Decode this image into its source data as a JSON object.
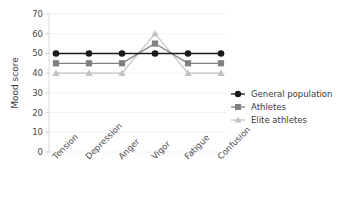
{
  "chart_data": {
    "type": "line",
    "title": "",
    "xlabel": "",
    "ylabel": "Mood score",
    "categories": [
      "Tension",
      "Depression",
      "Anger",
      "Vigor",
      "Fatigue",
      "Confusion"
    ],
    "ylim": [
      0,
      70
    ],
    "yticks": [
      0,
      10,
      20,
      30,
      40,
      50,
      60,
      70
    ],
    "grid": true,
    "legend_position": "right",
    "series": [
      {
        "name": "General population",
        "color": "#1a1a1a",
        "marker": "circle",
        "values": [
          50,
          50,
          50,
          50,
          50,
          50
        ]
      },
      {
        "name": "Athletes",
        "color": "#808080",
        "marker": "square",
        "values": [
          45,
          45,
          45,
          55,
          45,
          45
        ]
      },
      {
        "name": "Elite athletes",
        "color": "#c2c2c2",
        "marker": "triangle",
        "values": [
          40,
          40,
          40,
          60,
          40,
          40
        ]
      }
    ]
  },
  "axis": {
    "y_title": "Mood score",
    "y_tick_labels": [
      "70",
      "60",
      "50",
      "40",
      "30",
      "20",
      "10",
      "0"
    ],
    "x_tick_labels": [
      "Tension",
      "Depression",
      "Anger",
      "Vigor",
      "Fatigue",
      "Confusion"
    ]
  },
  "legend": {
    "items": [
      {
        "label": "General population"
      },
      {
        "label": "Athletes"
      },
      {
        "label": "Elite athletes"
      }
    ]
  }
}
